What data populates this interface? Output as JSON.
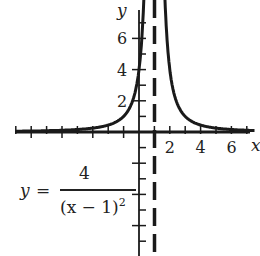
{
  "chart_data": {
    "type": "line",
    "title": "",
    "function": "y = 4/(x-1)^2",
    "xlabel": "x",
    "ylabel": "y",
    "xlim": [
      -8,
      7.5
    ],
    "ylim": [
      -8,
      8.5
    ],
    "x_tick_labels": [
      "2",
      "4",
      "6"
    ],
    "y_tick_labels": [
      "2",
      "4",
      "6"
    ],
    "asymptote": {
      "type": "vertical",
      "x": 1,
      "style": "dashed"
    },
    "series": [
      {
        "name": "y = 4/(x-1)^2",
        "x": [
          -8,
          -6,
          -4,
          -2,
          -1,
          0,
          0.25,
          1.75,
          2,
          3,
          4,
          6,
          7.5
        ],
        "values": [
          0.05,
          0.08,
          0.16,
          0.44,
          1,
          4,
          7.1,
          7.1,
          4,
          1,
          0.44,
          0.16,
          0.09
        ]
      }
    ],
    "grid": false,
    "legend": null
  },
  "axes": {
    "x_label": "x",
    "y_label": "y"
  },
  "equation": {
    "lhs": "y",
    "eq": "=",
    "numerator": "4",
    "denominator": "(x − 1)",
    "exponent": "2"
  }
}
